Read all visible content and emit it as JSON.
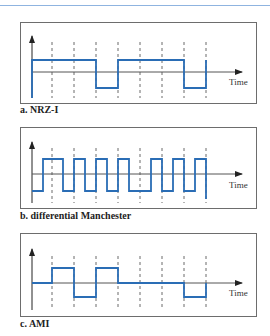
{
  "colors": {
    "signal": "#2a6db5",
    "axis": "#555555",
    "frame": "#6d6d6d",
    "rule": "#8fb4e0"
  },
  "axis_label": "Time",
  "panels": [
    {
      "id": "nrz-i",
      "caption": "a. NRZ-I",
      "levels": {
        "high": 60,
        "zero": 72,
        "low": 88
      },
      "signal_points": "32,98 32,60 96,60 96,88 118,88 118,60 184,60 184,88 206,88 206,60"
    },
    {
      "id": "differential-manchester",
      "caption": "b. differential Manchester",
      "levels": {
        "high": 159,
        "zero": 174,
        "low": 191
      },
      "signal_points": "32,191 43,191 43,159 63,159 63,191 74,191 74,159 85,159 85,191 96,191 96,159 107,159 107,191 118,191 118,159 129,159 129,191 151,191 151,159 162,159 162,191 173,191 173,159 184,159 184,191 195,191 195,159 206,159 206,199"
    },
    {
      "id": "ami",
      "caption": "c. AMI",
      "levels": {
        "high": 268,
        "zero": 283,
        "low": 297
      },
      "signal_points": "32,283 52,283 52,268 74,268 74,297 96,297 96,268 118,268 118,283 184,283 184,297 206,297 206,283"
    }
  ]
}
